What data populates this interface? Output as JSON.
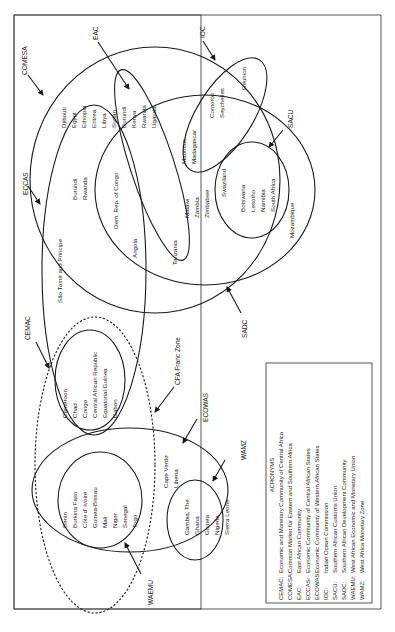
{
  "groups": {
    "comesa": {
      "label": "COMESA",
      "countries": [
        "Djibouti",
        "Egypt",
        "Ethiopia",
        "Eritrea",
        "Libya",
        "Sudan"
      ]
    },
    "eac": {
      "label": "EAC",
      "countries": [
        "Burundi",
        "Kenya",
        "Rwanda",
        "Uganda"
      ]
    },
    "ioc": {
      "label": "IOC",
      "countries": [
        "Comoros",
        "Seychelles",
        "Reunion"
      ],
      "shared": [
        "Mauritius",
        "Madagascar"
      ]
    },
    "eccas": {
      "label": "ECCAS",
      "countries": [
        "Burundi",
        "Rwanda",
        "Dem. Rep. of Congo",
        "Angola",
        "São Tomé and Principe"
      ]
    },
    "sadc": {
      "label": "SADC",
      "countries": [
        "Malawi",
        "Zambia",
        "Zimbabwe",
        "Tanzania",
        "Mozambique"
      ]
    },
    "sacu": {
      "label": "SACU",
      "countries": [
        "Swaziland",
        "Botswana",
        "Lesotho",
        "Namibia",
        "South Africa"
      ]
    },
    "cemac": {
      "label": "CEMAC",
      "countries": [
        "Cameroon",
        "Chad",
        "Congo",
        "Central African Republic",
        "Equatorial Guinea",
        "Gabon"
      ]
    },
    "cfa": {
      "label": "CFA Franc Zone"
    },
    "ecowas": {
      "label": "ECOWAS",
      "countries": [
        "Cape Verde",
        "Liberia"
      ]
    },
    "waemu": {
      "label": "WAEMU",
      "countries": [
        "Benin",
        "Burkina Faso",
        "Côte d' Ivoire",
        "Guinea-Bissau",
        "Mali",
        "Niger",
        "Senegal",
        "Togo"
      ]
    },
    "wamz": {
      "label": "WAMZ",
      "countries": [
        "Gambia, The",
        "Ghana",
        "Guinea",
        "Nigeria",
        "Sierra Leone"
      ]
    }
  },
  "legend": {
    "title": "ACRONYMS",
    "entries": [
      {
        "abbr": "CEMAC:",
        "full": "Economic and Monetary Community of Central Africa"
      },
      {
        "abbr": "COMESA:",
        "full": "Common Market for Eastern and Southern Africa"
      },
      {
        "abbr": "EAC:",
        "full": "East African Community"
      },
      {
        "abbr": "ECCAS:",
        "full": "Economic Community of Central African States"
      },
      {
        "abbr": "ECOWAS:",
        "full": "Economic Community of Western African States"
      },
      {
        "abbr": "IOC:",
        "full": "Indian Ocean Commission"
      },
      {
        "abbr": "SACU:",
        "full": "Southern African Customs Union"
      },
      {
        "abbr": "SADC:",
        "full": "Southern African Development Community"
      },
      {
        "abbr": "WAEMU:",
        "full": "West African Economic and Monetary Union"
      },
      {
        "abbr": "WAMZ:",
        "full": "West Africa Monetary Zone"
      }
    ]
  },
  "colors": {
    "ink": "#1a1a1a",
    "background": "#ffffff"
  }
}
